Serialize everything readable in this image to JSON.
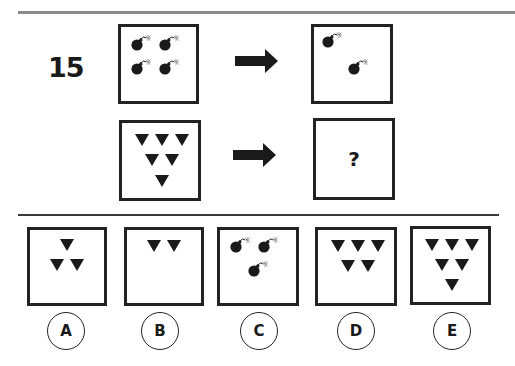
{
  "question": {
    "number": "15",
    "unknown_symbol": "?",
    "example_pair": {
      "left": {
        "shape": "bomb-icon",
        "count": 4
      },
      "right": {
        "shape": "bomb-icon",
        "count": 2
      }
    },
    "query_pair": {
      "left": {
        "shape": "triangle-down-icon",
        "count": 6
      },
      "right": {
        "shape": "unknown",
        "label": "?"
      }
    }
  },
  "options": [
    {
      "label": "A",
      "shape": "triangle-down-icon",
      "count": 3
    },
    {
      "label": "B",
      "shape": "triangle-down-icon",
      "count": 2
    },
    {
      "label": "C",
      "shape": "bomb-icon",
      "count": 3
    },
    {
      "label": "D",
      "shape": "triangle-down-icon",
      "count": 5
    },
    {
      "label": "E",
      "shape": "triangle-down-icon",
      "count": 6
    }
  ],
  "colors": {
    "ink": "#1a1a1a",
    "rule": "#8a8a8a"
  }
}
